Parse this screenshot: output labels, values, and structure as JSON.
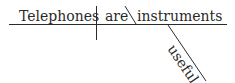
{
  "diagram": {
    "type": "sentence-diagram",
    "sentence": "Telephones are useful instruments",
    "subject": "Telephones",
    "verb": "are",
    "predicate_nominative": "instruments",
    "modifier": "useful",
    "line_color": "#2a2a2a"
  }
}
